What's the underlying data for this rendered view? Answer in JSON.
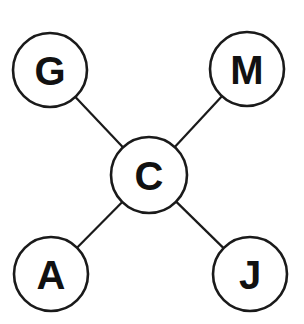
{
  "diagram": {
    "type": "star-graph",
    "center_node": "C",
    "colors": {
      "stroke": "#1a1a1a",
      "fill": "#ffffff",
      "text": "#111111"
    },
    "nodes": [
      {
        "id": "G",
        "label": "G",
        "cx": 50,
        "cy": 70,
        "r": 37
      },
      {
        "id": "M",
        "label": "M",
        "cx": 247,
        "cy": 69,
        "r": 37
      },
      {
        "id": "C",
        "label": "C",
        "cx": 149,
        "cy": 175,
        "r": 38
      },
      {
        "id": "A",
        "label": "A",
        "cx": 51,
        "cy": 274,
        "r": 37
      },
      {
        "id": "J",
        "label": "J",
        "cx": 250,
        "cy": 274,
        "r": 37
      }
    ],
    "edges": [
      {
        "from": "C",
        "to": "G"
      },
      {
        "from": "C",
        "to": "M"
      },
      {
        "from": "C",
        "to": "A"
      },
      {
        "from": "C",
        "to": "J"
      }
    ]
  }
}
